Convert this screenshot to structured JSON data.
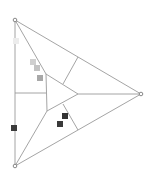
{
  "diagram": {
    "type": "triangular-subdivision",
    "colors": {
      "edge": "#9a9a9a",
      "vertex": "#7a7a7a",
      "marker_light": "#c6c6c6",
      "marker_mid": "#a8a8a8",
      "marker_faint": "#ececec",
      "marker_dark": "#3a3a3a"
    },
    "outer_vertices": [
      {
        "name": "top-left",
        "x": 15,
        "y": 20
      },
      {
        "name": "right",
        "x": 141,
        "y": 94
      },
      {
        "name": "bottom-left",
        "x": 15,
        "y": 166
      }
    ],
    "inner_vertices": [
      {
        "name": "inner-top",
        "x": 46,
        "y": 74
      },
      {
        "name": "inner-right",
        "x": 78,
        "y": 94
      },
      {
        "name": "inner-bottom",
        "x": 47,
        "y": 111
      }
    ],
    "markers": [
      {
        "x": 16,
        "y": 41,
        "shade": "faint"
      },
      {
        "x": 33,
        "y": 62,
        "shade": "light"
      },
      {
        "x": 37,
        "y": 68,
        "shade": "light"
      },
      {
        "x": 40,
        "y": 78,
        "shade": "mid"
      },
      {
        "x": 14,
        "y": 128,
        "shade": "dark"
      },
      {
        "x": 65,
        "y": 116,
        "shade": "dark"
      },
      {
        "x": 60,
        "y": 124,
        "shade": "dark"
      }
    ]
  }
}
